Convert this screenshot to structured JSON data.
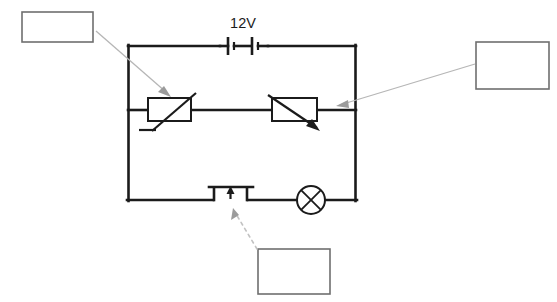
{
  "diagram": {
    "type": "circuit-schematic",
    "background_color": "#ffffff",
    "wire_color": "#1b1b1b",
    "callout_border_color": "#6f6f6f",
    "leader_color": "#b6b6b6"
  },
  "labels": {
    "battery_voltage": "12V"
  },
  "components": [
    {
      "id": "battery",
      "name": "battery-12v",
      "symbol": "two-cell-battery",
      "label": "12V",
      "position": "top-branch-center"
    },
    {
      "id": "thermistor",
      "name": "thermistor",
      "symbol": "rectangle-with-diagonal-and-foot",
      "label": "",
      "position": "middle-branch-left"
    },
    {
      "id": "variable-resistor",
      "name": "variable-resistor",
      "symbol": "rectangle-with-diagonal-arrow",
      "label": "",
      "position": "middle-branch-right"
    },
    {
      "id": "push-switch",
      "name": "push-to-make-switch",
      "symbol": "push-button-switch",
      "label": "",
      "position": "bottom-branch-left"
    },
    {
      "id": "lamp",
      "name": "lamp",
      "symbol": "circle-with-cross",
      "label": "",
      "position": "bottom-branch-right"
    }
  ],
  "callouts": [
    {
      "id": "callout-top-left",
      "name": "callout-box-thermistor",
      "text": "",
      "points_to": "thermistor",
      "leader_style": "solid-arrow"
    },
    {
      "id": "callout-right",
      "name": "callout-box-variable-resistor",
      "text": "",
      "points_to": "variable-resistor",
      "leader_style": "solid-arrow"
    },
    {
      "id": "callout-bottom",
      "name": "callout-box-switch",
      "text": "",
      "points_to": "push-switch",
      "leader_style": "dotted-arrow"
    }
  ]
}
